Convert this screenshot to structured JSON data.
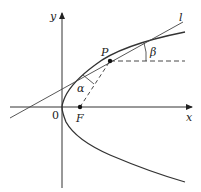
{
  "diagram": {
    "type": "geometry-parabola-reflection",
    "labels": {
      "y_axis": "y",
      "x_axis": "x",
      "origin": "0",
      "focus": "F",
      "point": "P",
      "tangent_line": "l",
      "angle_alpha": "α",
      "angle_beta": "β"
    },
    "colors": {
      "stroke": "#333333",
      "background": "#ffffff"
    }
  }
}
